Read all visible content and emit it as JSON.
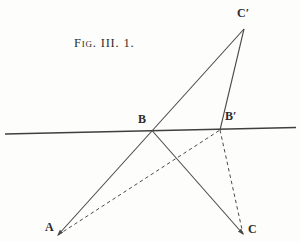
{
  "figure": {
    "caption": "Fig. III. 1.",
    "colors": {
      "background": "#fdfdfb",
      "line": "#4a4a4a",
      "horizon_line": "#3f3f3f",
      "text": "#2b2b2b"
    },
    "points": {
      "A": {
        "label": "A",
        "x": 58,
        "y": 235,
        "label_x": 45,
        "label_y": 221
      },
      "B": {
        "label": "B",
        "x": 152,
        "y": 130.5,
        "label_x": 138,
        "label_y": 113
      },
      "Bprime": {
        "label": "B′",
        "x": 220,
        "y": 130,
        "label_x": 225,
        "label_y": 110
      },
      "C": {
        "label": "C",
        "x": 243,
        "y": 234,
        "label_x": 248,
        "label_y": 223
      },
      "Cprime": {
        "label": "C′",
        "x": 244,
        "y": 29,
        "label_x": 237,
        "label_y": 7
      }
    },
    "lines": [
      {
        "name": "horizon-line",
        "from": [
          5,
          134
        ],
        "to": [
          296,
          127.5
        ],
        "style": "solid",
        "width": 1.7
      },
      {
        "name": "line-A-B-Cprime",
        "from": "A",
        "to": "Cprime",
        "style": "solid",
        "width": 1.1,
        "arrow_at_from": true
      },
      {
        "name": "line-Cprime-Bprime",
        "from": "Cprime",
        "to": "Bprime",
        "style": "solid",
        "width": 1.1
      },
      {
        "name": "line-B-C",
        "from": "B",
        "to": "C",
        "style": "solid",
        "width": 1.1,
        "arrow_at_to": true
      },
      {
        "name": "line-A-Bprime",
        "from": "A",
        "to": "Bprime",
        "style": "dashed",
        "width": 1
      },
      {
        "name": "line-Bprime-C",
        "from": "Bprime",
        "to": "C",
        "style": "dashed",
        "width": 1
      }
    ]
  }
}
